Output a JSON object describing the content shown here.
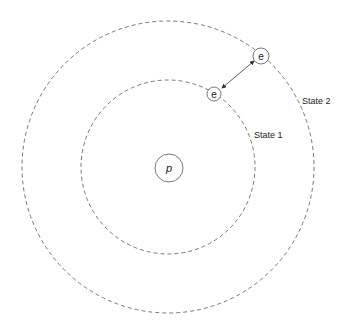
{
  "diagram": {
    "nucleus": {
      "label": "p"
    },
    "electron_inner": {
      "label": "e"
    },
    "electron_outer": {
      "label": "e"
    },
    "orbits": [
      {
        "label": "State 1"
      },
      {
        "label": "State 2"
      }
    ]
  }
}
